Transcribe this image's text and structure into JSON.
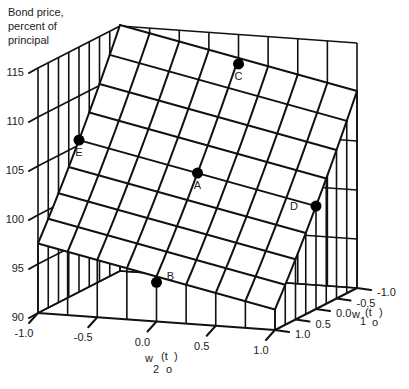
{
  "chart_data": {
    "type": "surface3d",
    "title": "",
    "zlabel_lines": [
      "Bond price,",
      "percent of",
      "principal"
    ],
    "xlabel": {
      "main": "w",
      "sub": "2",
      "paren_open": "(t",
      "paren_sub": "o",
      "paren_close": ")"
    },
    "ylabel": {
      "main": "w",
      "sub": "1",
      "paren_open": "(t",
      "paren_sub": "o",
      "paren_close": ")"
    },
    "x_axis_name": "w2(t0)",
    "y_axis_name": "w1(t0)",
    "x_range": [
      -1.0,
      1.0
    ],
    "y_range": [
      -1.0,
      1.0
    ],
    "z_range": [
      90,
      115
    ],
    "x_ticks": [
      "-1.0",
      "-0.5",
      "0.0",
      "0.5",
      "1.0"
    ],
    "y_ticks": [
      "-1.0",
      "-0.5",
      "0.0",
      "0.5",
      "1.0"
    ],
    "z_ticks": [
      "90",
      "95",
      "100",
      "105",
      "110",
      "115"
    ],
    "x_tick_values": [
      -1.0,
      -0.5,
      0.0,
      0.5,
      1.0
    ],
    "y_tick_values": [
      -1.0,
      -0.5,
      0.0,
      0.5,
      1.0
    ],
    "z_tick_values": [
      90,
      95,
      100,
      105,
      110,
      115
    ],
    "grid_divisions": 8,
    "surface_model": {
      "base": 103,
      "slope_w2": -2.5,
      "slope_w1": -9.0
    },
    "points": [
      {
        "label": "A",
        "w2": 0.0,
        "w1": 0.0,
        "price": 103.0
      },
      {
        "label": "B",
        "w2": 0.0,
        "w1": 1.0,
        "price": 94.0
      },
      {
        "label": "C",
        "w2": 0.0,
        "w1": -1.0,
        "price": 112.0
      },
      {
        "label": "D",
        "w2": 1.0,
        "w1": 0.0,
        "price": 100.5
      },
      {
        "label": "E",
        "w2": -1.0,
        "w1": 0.0,
        "price": 105.5
      }
    ]
  }
}
